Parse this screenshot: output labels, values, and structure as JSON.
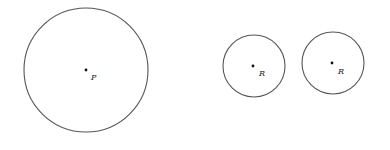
{
  "diagram": {
    "circles": [
      {
        "id": "circle-p",
        "cx": 86,
        "cy": 70,
        "r": 62,
        "label": "P"
      },
      {
        "id": "circle-r1",
        "cx": 254,
        "cy": 66,
        "r": 31,
        "label": "R"
      },
      {
        "id": "circle-r2",
        "cx": 333,
        "cy": 63,
        "r": 31,
        "label": "R"
      }
    ],
    "stroke_color": "#555555"
  }
}
